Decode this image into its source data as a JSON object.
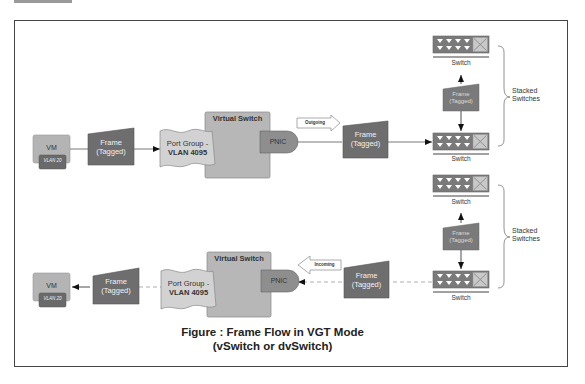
{
  "diagram": {
    "colors": {
      "frame_fill": "#6e6e6e",
      "vm_fill": "#b4b4b4",
      "vm_tag_fill": "#6a6a6a",
      "portgroup_fill": "#d2d2d2",
      "vswitch_fill": "#b7b7b7",
      "pnic_fill": "#8e8e8e",
      "switch_fill": "#7a7a7a",
      "border": "#444444"
    },
    "outgoing": {
      "vm": {
        "label": "VM",
        "vlan": "VLAN 20"
      },
      "frame1": {
        "line1": "Frame",
        "line2": "(Tagged)"
      },
      "port_group": {
        "line1": "Port Group -",
        "line2": "VLAN 4095"
      },
      "vswitch": {
        "title": "Virtual Switch"
      },
      "pnic": {
        "label": "PNIC"
      },
      "direction": {
        "label": "Outgoing"
      },
      "frame2": {
        "line1": "Frame",
        "line2": "(Tagged)"
      },
      "switch_top": {
        "label": "Switch"
      },
      "frame_between": {
        "line1": "Frame",
        "line2": "(Tagged)"
      },
      "switch_bottom": {
        "label": "Switch"
      },
      "stack_label": {
        "line1": "Stacked",
        "line2": "Switches"
      }
    },
    "incoming": {
      "vm": {
        "label": "VM",
        "vlan": "VLAN 20"
      },
      "frame1": {
        "line1": "Frame",
        "line2": "(Tagged)"
      },
      "port_group": {
        "line1": "Port Group -",
        "line2": "VLAN 4095"
      },
      "vswitch": {
        "title": "Virtual Switch"
      },
      "pnic": {
        "label": "PNIC"
      },
      "direction": {
        "label": "Incoming"
      },
      "frame2": {
        "line1": "Frame",
        "line2": "(Tagged)"
      },
      "switch_top": {
        "label": "Switch"
      },
      "frame_between": {
        "line1": "Frame",
        "line2": "(Tagged)"
      },
      "switch_bottom": {
        "label": "Switch"
      },
      "stack_label": {
        "line1": "Stacked",
        "line2": "Switches"
      }
    },
    "caption": {
      "line1": "Figure : Frame Flow in VGT Mode",
      "line2": "(vSwitch or dvSwitch)"
    }
  }
}
